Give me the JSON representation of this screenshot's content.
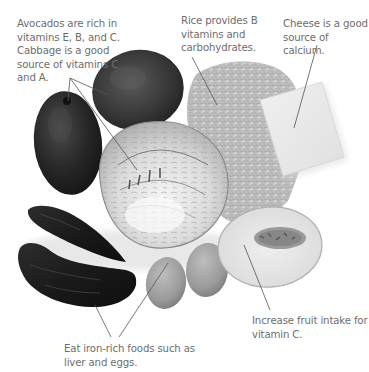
{
  "figure": {
    "style": "grayscale textbook food illustration with leader-line annotations",
    "background": "#ffffff",
    "caption_color": "#6e6e6e",
    "line_color": "#555555"
  },
  "captions": {
    "avocado_cabbage": "Avocados are rich in\nvitamins E, B, and C.\nCabbage is a good\nsource of vitamins C\nand A.",
    "rice": "Rice provides B\nvitamins and\ncarbohydrates.",
    "cheese": "Cheese is a good\nsource of calcium.",
    "fruit": "Increase fruit intake for\nvitamin C.",
    "iron": "Eat iron-rich foods such as\nliver and eggs."
  },
  "foods": [
    {
      "name": "avocado-left",
      "label": "Avocado"
    },
    {
      "name": "avocado-top",
      "label": "Avocado"
    },
    {
      "name": "cabbage",
      "label": "Cabbage (halved)"
    },
    {
      "name": "rice",
      "label": "Rice"
    },
    {
      "name": "cheese",
      "label": "Cheese"
    },
    {
      "name": "liver-top",
      "label": "Liver"
    },
    {
      "name": "liver-bottom",
      "label": "Liver"
    },
    {
      "name": "egg-left",
      "label": "Egg"
    },
    {
      "name": "egg-right",
      "label": "Egg"
    },
    {
      "name": "melon",
      "label": "Melon (halved)"
    }
  ]
}
